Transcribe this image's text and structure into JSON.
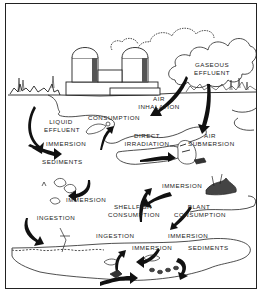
{
  "diagram": {
    "type": "radiation exposure pathways illustration",
    "colors": {
      "ink": "#222222",
      "background": "#ffffff"
    },
    "labels": {
      "gaseous_effluent_1": "GASEOUS",
      "gaseous_effluent_2": "EFFLUENT",
      "air_inhalation_1": "AIR",
      "air_inhalation_2": "INHALATION",
      "liquid_effluent_1": "LIQUID",
      "liquid_effluent_2": "EFFLUENT",
      "consumption_top": "CONSUMPTION",
      "immersion_left": "IMMERSION",
      "direct_irradiation_1": "DIRECT",
      "direct_irradiation_2": "IRRADIATION",
      "air_submersion_1": "AIR",
      "air_submersion_2": "SUBMERSION",
      "sediments_left": "SEDIMENTS",
      "immersion_right": "IMMERSION",
      "immersion_ducks": "IMMERSION",
      "shellfish_consumption_1": "SHELLFISH",
      "shellfish_consumption_2": "CONSUMPTION",
      "plant_consumption_1": "PLANT",
      "plant_consumption_2": "CONSUMPTION",
      "ingestion_left": "INGESTION",
      "ingestion_lower": "INGESTION",
      "immersion_lower_right": "IMMERSION",
      "immersion_bottom": "IMMERSION",
      "sediments_bottom": "SEDIMENTS"
    }
  }
}
